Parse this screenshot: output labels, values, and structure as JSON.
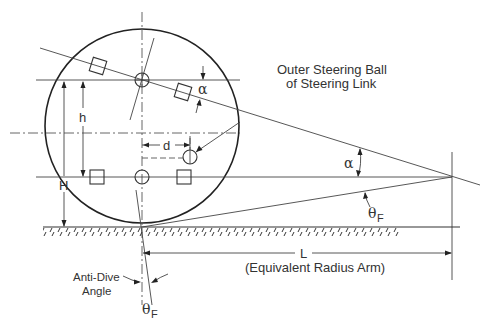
{
  "diagram": {
    "labels": {
      "outer_ball_line1": "Outer Steering Ball",
      "outer_ball_line2": "of Steering Link",
      "alpha_upper": "α",
      "alpha_right": "α",
      "theta_right": "θ",
      "theta_right_sub": "F",
      "theta_bottom": "θ",
      "theta_bottom_sub": "F",
      "h": "h",
      "H": "H",
      "d": "d",
      "L": "L",
      "L_caption": "(Equivalent Radius Arm)",
      "anti_dive_line1": "Anti-Dive",
      "anti_dive_line2": "Angle"
    },
    "elements": [
      "wheel-outline",
      "wheel-center-vertical-axis",
      "wheel-center-horizontal-axis",
      "ground-line",
      "steering-axis-line",
      "upper-arm-line",
      "lower-arm-line",
      "equivalent-radius-arm-line",
      "pivot-vertical-line"
    ],
    "colors": {
      "stroke": "#333333",
      "background": "#ffffff"
    }
  }
}
